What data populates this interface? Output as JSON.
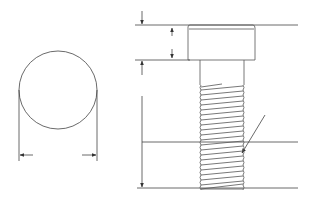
{
  "diagram": {
    "title": "",
    "type": "technical-drawing",
    "colors": {
      "line": "#333333",
      "background": "#ffffff"
    },
    "views": [
      {
        "name": "end-view",
        "shape": "circle",
        "dimension": "diameter"
      },
      {
        "name": "side-view",
        "parts": [
          "head",
          "shank",
          "threaded-section"
        ],
        "dimensions": [
          "overall-height",
          "head-height",
          "thread-length"
        ]
      }
    ],
    "labels": []
  }
}
